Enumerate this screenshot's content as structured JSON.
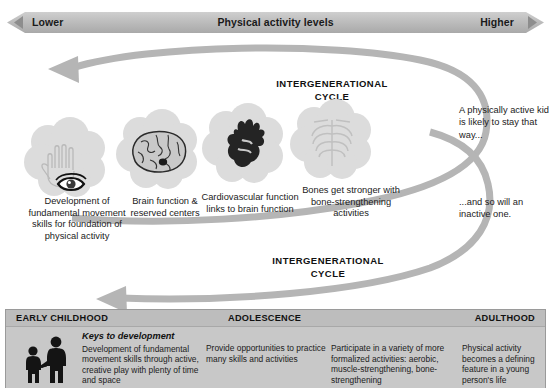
{
  "banner": {
    "left_label": "Lower",
    "center_label": "Physical activity levels",
    "right_label": "Higher"
  },
  "cycle": {
    "top_label": "INTERGENERATIONAL CYCLE",
    "bottom_label": "INTERGENERATIONAL CYCLE"
  },
  "organs": [
    {
      "icon": "hand-eye-icon",
      "caption": "Development of fundamental movement skills for foundation of physical activity"
    },
    {
      "icon": "brain-icon",
      "caption": "Brain function & reserved centers"
    },
    {
      "icon": "heart-icon",
      "caption": "Cardiovascular function links to brain function"
    },
    {
      "icon": "ribcage-icon",
      "caption": "Bones get stronger with bone-strengthening activities"
    }
  ],
  "notes": {
    "active": "A physically active kid is likely to stay that way...",
    "inactive": "...and so will an inactive one."
  },
  "lifecycle": {
    "stages": [
      {
        "label": "EARLY CHILDHOOD"
      },
      {
        "label": "ADOLESCENCE"
      },
      {
        "label": "ADULTHOOD"
      }
    ],
    "keys_title": "Keys to development",
    "columns": [
      "Development of fundamental movement skills through active, creative play with plenty of time and space",
      "Provide opportunities to practice many skills and activities",
      "Participate in a variety of more formalized activities: aerobic, muscle-strengthening, bone-strengthening",
      "Physical activity becomes a defining feature in a young person's life"
    ]
  },
  "colors": {
    "banner_gray": "#b8b8b8",
    "arrow_gray": "#b5b5b5",
    "cloud_gray": "#dcdcdc",
    "panel_gray": "#c8c8c8",
    "panel_head_gray": "#bdbdbd",
    "text_dark": "#1b1b1b"
  }
}
